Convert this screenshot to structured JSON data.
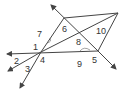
{
  "diagram": {
    "stroke_color": "#444444",
    "labels": [
      {
        "id": "1",
        "text": "1",
        "x": 33,
        "y": 50
      },
      {
        "id": "2",
        "text": "2",
        "x": 14,
        "y": 64
      },
      {
        "id": "3",
        "text": "3",
        "x": 25,
        "y": 72
      },
      {
        "id": "4",
        "text": "4",
        "x": 40,
        "y": 63
      },
      {
        "id": "5",
        "text": "5",
        "x": 92,
        "y": 63
      },
      {
        "id": "6",
        "text": "6",
        "x": 62,
        "y": 32
      },
      {
        "id": "7",
        "text": "7",
        "x": 37,
        "y": 37
      },
      {
        "id": "8",
        "text": "8",
        "x": 76,
        "y": 45
      },
      {
        "id": "9",
        "text": "9",
        "x": 77,
        "y": 67
      },
      {
        "id": "10",
        "text": "10",
        "x": 96,
        "y": 34
      }
    ]
  }
}
